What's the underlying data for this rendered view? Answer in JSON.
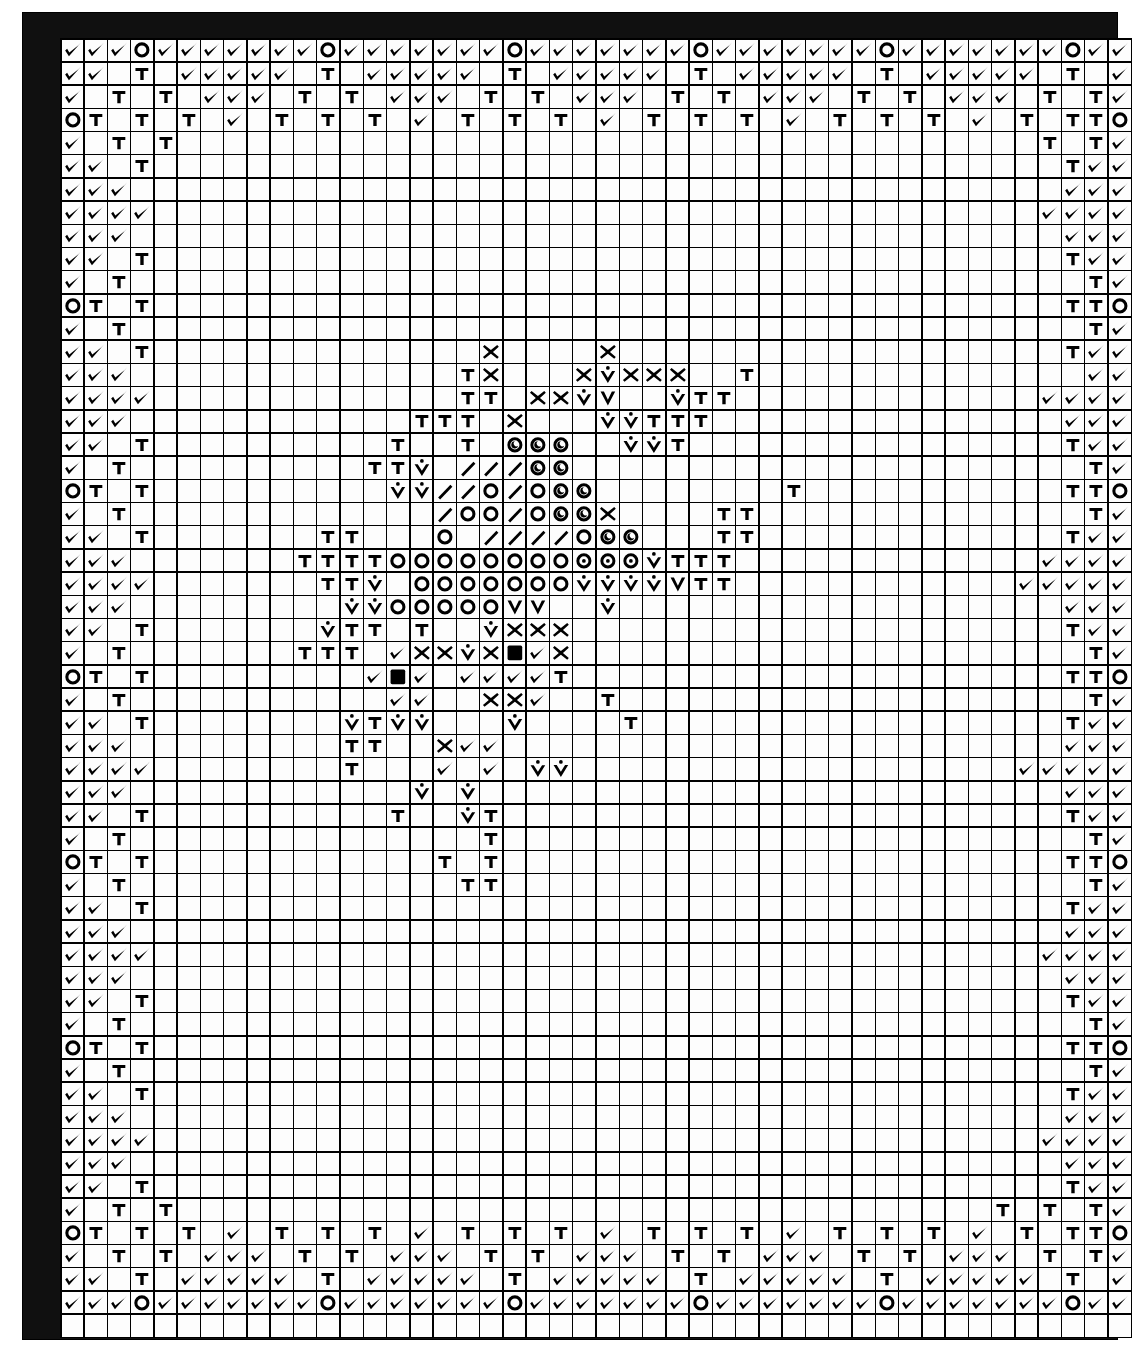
{
  "document": {
    "type": "cross-stitch-chart",
    "title": "Counted Cross Stitch Pattern Chart",
    "grid": {
      "columns": 46,
      "rows": 56
    },
    "frame_color": "#101010",
    "cell_color": "#fdfdfd",
    "line_color": "#000000"
  },
  "symbol_legend": [
    {
      "key": "check",
      "name": "checkmark-symbol",
      "glyph": "✔"
    },
    {
      "key": "tee",
      "name": "tee-symbol",
      "glyph": "T"
    },
    {
      "key": "ring",
      "name": "open-circle-symbol",
      "glyph": "○"
    },
    {
      "key": "ringdot",
      "name": "circle-with-dot-symbol",
      "glyph": "⊙"
    },
    {
      "key": "ringcoma",
      "name": "circle-with-comma-symbol",
      "glyph": "◔"
    },
    {
      "key": "ex",
      "name": "cross-x-symbol",
      "glyph": "✕"
    },
    {
      "key": "vdot",
      "name": "v-with-dot-symbol",
      "glyph": "V̇"
    },
    {
      "key": "vee",
      "name": "plain-v-symbol",
      "glyph": "V"
    },
    {
      "key": "slash",
      "name": "diagonal-slash-symbol",
      "glyph": "/"
    },
    {
      "key": "filled",
      "name": "filled-square-symbol",
      "glyph": "■"
    },
    {
      "key": "blank",
      "name": "empty-cell",
      "glyph": ""
    }
  ],
  "chart_data": {
    "type": "heatmap",
    "xlabel": "",
    "ylabel": "",
    "columns": 46,
    "rows": 56,
    "legend_position": "none",
    "grid": true,
    "symbols": [
      "check",
      "tee",
      "ring",
      "ringdot",
      "ringcoma",
      "ex",
      "vdot",
      "vee",
      "slash",
      "filled",
      "blank"
    ],
    "cells": [
      "check,check,check,ring,check,check,check,check,check,check,check,ring,check,check,check,check,check,check,check,ring,check,check,check,check,check,check,check,ring,check,check,check,check,check,check,check,ring,check,check,check,check,check,check,check,ring,check,check",
      "check,check,blank,tee,blank,check,check,check,check,check,blank,tee,blank,check,check,check,check,check,blank,tee,blank,check,check,check,check,check,blank,tee,blank,check,check,check,check,check,blank,tee,blank,check,check,check,check,check,blank,tee,blank,check",
      "check,blank,tee,blank,tee,blank,check,check,check,blank,tee,blank,tee,blank,check,check,check,blank,tee,blank,tee,blank,check,check,check,blank,tee,blank,tee,blank,check,check,check,blank,tee,blank,tee,blank,check,check,check,blank,tee,blank,tee,check",
      "ring,tee,blank,tee,blank,tee,blank,check,blank,tee,blank,tee,blank,tee,blank,check,blank,tee,blank,tee,blank,tee,blank,check,blank,tee,blank,tee,blank,tee,blank,check,blank,tee,blank,tee,blank,tee,blank,check,blank,tee,blank,tee,tee,ring",
      "check,blank,tee,blank,tee,blank,blank,blank,blank,blank,blank,blank,blank,blank,blank,blank,blank,blank,blank,blank,blank,blank,blank,blank,blank,blank,blank,blank,blank,blank,blank,blank,blank,blank,blank,blank,blank,blank,blank,blank,blank,blank,tee,blank,tee,check",
      "check,check,blank,tee,blank,blank,blank,blank,blank,blank,blank,blank,blank,blank,blank,blank,blank,blank,blank,blank,blank,blank,blank,blank,blank,blank,blank,blank,blank,blank,blank,blank,blank,blank,blank,blank,blank,blank,blank,blank,blank,blank,blank,tee,check,check",
      "check,check,check,blank,blank,blank,blank,blank,blank,blank,blank,blank,blank,blank,blank,blank,blank,blank,blank,blank,blank,blank,blank,blank,blank,blank,blank,blank,blank,blank,blank,blank,blank,blank,blank,blank,blank,blank,blank,blank,blank,blank,blank,check,check,check",
      "check,check,check,check,blank,blank,blank,blank,blank,blank,blank,blank,blank,blank,blank,blank,blank,blank,blank,blank,blank,blank,blank,blank,blank,blank,blank,blank,blank,blank,blank,blank,blank,blank,blank,blank,blank,blank,blank,blank,blank,blank,check,check,check,check",
      "check,check,check,blank,blank,blank,blank,blank,blank,blank,blank,blank,blank,blank,blank,blank,blank,blank,blank,blank,blank,blank,blank,blank,blank,blank,blank,blank,blank,blank,blank,blank,blank,blank,blank,blank,blank,blank,blank,blank,blank,blank,blank,check,check,check",
      "check,check,blank,tee,blank,blank,blank,blank,blank,blank,blank,blank,blank,blank,blank,blank,blank,blank,blank,blank,blank,blank,blank,blank,blank,blank,blank,blank,blank,blank,blank,blank,blank,blank,blank,blank,blank,blank,blank,blank,blank,blank,blank,tee,check,check",
      "check,blank,tee,blank,blank,blank,blank,blank,blank,blank,blank,blank,blank,blank,blank,blank,blank,blank,blank,blank,blank,blank,blank,blank,blank,blank,blank,blank,blank,blank,blank,blank,blank,blank,blank,blank,blank,blank,blank,blank,blank,blank,blank,blank,tee,check",
      "ring,tee,blank,tee,blank,blank,blank,blank,blank,blank,blank,blank,blank,blank,blank,blank,blank,blank,blank,blank,blank,blank,blank,blank,blank,blank,blank,blank,blank,blank,blank,blank,blank,blank,blank,blank,blank,blank,blank,blank,blank,blank,blank,tee,tee,ring",
      "check,blank,tee,blank,blank,blank,blank,blank,blank,blank,blank,blank,blank,blank,blank,blank,blank,blank,blank,blank,blank,blank,blank,blank,blank,blank,blank,blank,blank,blank,blank,blank,blank,blank,blank,blank,blank,blank,blank,blank,blank,blank,blank,blank,tee,check",
      "check,check,blank,tee,blank,blank,blank,blank,blank,blank,blank,blank,blank,blank,blank,blank,blank,blank,ex,blank,blank,blank,blank,ex,blank,blank,blank,blank,blank,blank,blank,blank,blank,blank,blank,blank,blank,blank,blank,blank,blank,blank,blank,tee,check,check",
      "check,check,check,blank,blank,blank,blank,blank,blank,blank,blank,blank,blank,blank,blank,blank,blank,tee,ex,blank,blank,blank,ex,vdot,ex,ex,ex,blank,blank,tee,blank,blank,blank,blank,blank,blank,blank,blank,blank,blank,blank,blank,blank,blank,check,check",
      "check,check,check,check,blank,blank,blank,blank,blank,blank,blank,blank,blank,blank,blank,blank,blank,tee,tee,blank,ex,ex,vdot,vee,blank,blank,vdot,tee,tee,blank,blank,blank,blank,blank,blank,blank,blank,blank,blank,blank,blank,blank,check,check,check,check",
      "check,check,check,blank,blank,blank,blank,blank,blank,blank,blank,blank,blank,blank,blank,tee,tee,tee,blank,ex,blank,blank,blank,vdot,vdot,tee,tee,tee,blank,blank,blank,blank,blank,blank,blank,blank,blank,blank,blank,blank,blank,blank,blank,check,check,check",
      "check,check,blank,tee,blank,blank,blank,blank,blank,blank,blank,blank,blank,blank,tee,blank,blank,tee,blank,ringcoma,ringcoma,ringcoma,blank,blank,vdot,vdot,tee,blank,blank,blank,blank,blank,blank,blank,blank,blank,blank,blank,blank,blank,blank,blank,blank,tee,check,check",
      "check,blank,tee,blank,blank,blank,blank,blank,blank,blank,blank,blank,blank,tee,tee,vdot,blank,slash,slash,slash,ringcoma,ringcoma,blank,blank,blank,blank,blank,blank,blank,blank,blank,blank,blank,blank,blank,blank,blank,blank,blank,blank,blank,blank,blank,blank,tee,check",
      "ring,tee,blank,tee,blank,blank,blank,blank,blank,blank,blank,blank,blank,blank,vdot,vdot,slash,slash,ring,slash,ring,ringcoma,ringcoma,blank,blank,blank,blank,blank,blank,blank,blank,tee,blank,blank,blank,blank,blank,blank,blank,blank,blank,blank,blank,tee,tee,ring",
      "check,blank,tee,blank,blank,blank,blank,blank,blank,blank,blank,blank,blank,blank,blank,blank,slash,ring,ring,slash,ring,ringcoma,ringcoma,ex,blank,blank,blank,blank,tee,tee,blank,blank,blank,blank,blank,blank,blank,blank,blank,blank,blank,blank,blank,blank,tee,check",
      "check,check,blank,tee,blank,blank,blank,blank,blank,blank,blank,tee,tee,blank,blank,blank,ring,blank,slash,slash,slash,slash,ring,ringcoma,ringcoma,blank,blank,blank,tee,tee,blank,blank,blank,blank,blank,blank,blank,blank,blank,blank,blank,blank,blank,tee,check,check",
      "check,check,check,blank,blank,blank,blank,blank,blank,blank,tee,tee,tee,tee,ring,ring,ring,ring,ring,ring,ring,ring,ringdot,ringdot,ringdot,vdot,tee,tee,tee,blank,blank,blank,blank,blank,blank,blank,blank,blank,blank,blank,blank,blank,check,check,check,check",
      "check,check,check,check,blank,blank,blank,blank,blank,blank,blank,tee,tee,vdot,blank,ring,ring,ring,ring,ring,ring,ring,vdot,vdot,vdot,vdot,vee,tee,tee,blank,blank,blank,blank,blank,blank,blank,blank,blank,blank,blank,blank,check,check,check,check,check",
      "check,check,check,blank,blank,blank,blank,blank,blank,blank,blank,blank,vdot,vdot,ring,ring,ring,ring,ring,vee,vee,blank,blank,vdot,blank,blank,blank,blank,blank,blank,blank,blank,blank,blank,blank,blank,blank,blank,blank,blank,blank,blank,blank,check,check,check",
      "check,check,blank,tee,blank,blank,blank,blank,blank,blank,blank,vdot,tee,tee,blank,tee,blank,blank,vdot,ex,ex,ex,blank,blank,blank,blank,blank,blank,blank,blank,blank,blank,blank,blank,blank,blank,blank,blank,blank,blank,blank,blank,blank,tee,check,check",
      "check,blank,tee,blank,blank,blank,blank,blank,blank,blank,tee,tee,tee,blank,check,ex,ex,vdot,ex,filled,check,ex,blank,blank,blank,blank,blank,blank,blank,blank,blank,blank,blank,blank,blank,blank,blank,blank,blank,blank,blank,blank,blank,blank,tee,check",
      "ring,tee,blank,tee,blank,blank,blank,blank,blank,blank,blank,blank,blank,check,filled,check,blank,check,check,check,check,tee,blank,blank,blank,blank,blank,blank,blank,blank,blank,blank,blank,blank,blank,blank,blank,blank,blank,blank,blank,blank,blank,tee,tee,ring",
      "check,blank,tee,blank,blank,blank,blank,blank,blank,blank,blank,blank,blank,blank,check,check,blank,blank,ex,ex,check,blank,blank,tee,blank,blank,blank,blank,blank,blank,blank,blank,blank,blank,blank,blank,blank,blank,blank,blank,blank,blank,blank,blank,tee,check",
      "check,check,blank,tee,blank,blank,blank,blank,blank,blank,blank,blank,vdot,tee,vdot,vdot,blank,blank,blank,vdot,blank,blank,blank,blank,tee,blank,blank,blank,blank,blank,blank,blank,blank,blank,blank,blank,blank,blank,blank,blank,blank,blank,blank,tee,check,check",
      "check,check,check,blank,blank,blank,blank,blank,blank,blank,blank,blank,tee,tee,blank,blank,ex,check,check,blank,blank,blank,blank,blank,blank,blank,blank,blank,blank,blank,blank,blank,blank,blank,blank,blank,blank,blank,blank,blank,blank,blank,blank,check,check,check",
      "check,check,check,check,blank,blank,blank,blank,blank,blank,blank,blank,tee,blank,blank,blank,check,blank,check,blank,vdot,vdot,blank,blank,blank,blank,blank,blank,blank,blank,blank,blank,blank,blank,blank,blank,blank,blank,blank,blank,blank,check,check,check,check,check",
      "check,check,check,blank,blank,blank,blank,blank,blank,blank,blank,blank,blank,blank,blank,vdot,blank,vdot,blank,blank,blank,blank,blank,blank,blank,blank,blank,blank,blank,blank,blank,blank,blank,blank,blank,blank,blank,blank,blank,blank,blank,blank,blank,check,check,check",
      "check,check,blank,tee,blank,blank,blank,blank,blank,blank,blank,blank,blank,blank,tee,blank,blank,vdot,tee,blank,blank,blank,blank,blank,blank,blank,blank,blank,blank,blank,blank,blank,blank,blank,blank,blank,blank,blank,blank,blank,blank,blank,blank,tee,check,check",
      "check,blank,tee,blank,blank,blank,blank,blank,blank,blank,blank,blank,blank,blank,blank,blank,blank,blank,tee,blank,blank,blank,blank,blank,blank,blank,blank,blank,blank,blank,blank,blank,blank,blank,blank,blank,blank,blank,blank,blank,blank,blank,blank,blank,tee,check",
      "ring,tee,blank,tee,blank,blank,blank,blank,blank,blank,blank,blank,blank,blank,blank,blank,tee,blank,tee,blank,blank,blank,blank,blank,blank,blank,blank,blank,blank,blank,blank,blank,blank,blank,blank,blank,blank,blank,blank,blank,blank,blank,blank,tee,tee,ring",
      "check,blank,tee,blank,blank,blank,blank,blank,blank,blank,blank,blank,blank,blank,blank,blank,blank,tee,tee,blank,blank,blank,blank,blank,blank,blank,blank,blank,blank,blank,blank,blank,blank,blank,blank,blank,blank,blank,blank,blank,blank,blank,blank,blank,tee,check",
      "check,check,blank,tee,blank,blank,blank,blank,blank,blank,blank,blank,blank,blank,blank,blank,blank,blank,blank,blank,blank,blank,blank,blank,blank,blank,blank,blank,blank,blank,blank,blank,blank,blank,blank,blank,blank,blank,blank,blank,blank,blank,blank,tee,check,check",
      "check,check,check,blank,blank,blank,blank,blank,blank,blank,blank,blank,blank,blank,blank,blank,blank,blank,blank,blank,blank,blank,blank,blank,blank,blank,blank,blank,blank,blank,blank,blank,blank,blank,blank,blank,blank,blank,blank,blank,blank,blank,blank,check,check,check",
      "check,check,check,check,blank,blank,blank,blank,blank,blank,blank,blank,blank,blank,blank,blank,blank,blank,blank,blank,blank,blank,blank,blank,blank,blank,blank,blank,blank,blank,blank,blank,blank,blank,blank,blank,blank,blank,blank,blank,blank,blank,check,check,check,check",
      "check,check,check,blank,blank,blank,blank,blank,blank,blank,blank,blank,blank,blank,blank,blank,blank,blank,blank,blank,blank,blank,blank,blank,blank,blank,blank,blank,blank,blank,blank,blank,blank,blank,blank,blank,blank,blank,blank,blank,blank,blank,blank,check,check,check",
      "check,check,blank,tee,blank,blank,blank,blank,blank,blank,blank,blank,blank,blank,blank,blank,blank,blank,blank,blank,blank,blank,blank,blank,blank,blank,blank,blank,blank,blank,blank,blank,blank,blank,blank,blank,blank,blank,blank,blank,blank,blank,blank,tee,check,check",
      "check,blank,tee,blank,blank,blank,blank,blank,blank,blank,blank,blank,blank,blank,blank,blank,blank,blank,blank,blank,blank,blank,blank,blank,blank,blank,blank,blank,blank,blank,blank,blank,blank,blank,blank,blank,blank,blank,blank,blank,blank,blank,blank,blank,tee,check",
      "ring,tee,blank,tee,blank,blank,blank,blank,blank,blank,blank,blank,blank,blank,blank,blank,blank,blank,blank,blank,blank,blank,blank,blank,blank,blank,blank,blank,blank,blank,blank,blank,blank,blank,blank,blank,blank,blank,blank,blank,blank,blank,blank,tee,tee,ring",
      "check,blank,tee,blank,blank,blank,blank,blank,blank,blank,blank,blank,blank,blank,blank,blank,blank,blank,blank,blank,blank,blank,blank,blank,blank,blank,blank,blank,blank,blank,blank,blank,blank,blank,blank,blank,blank,blank,blank,blank,blank,blank,blank,blank,tee,check",
      "check,check,blank,tee,blank,blank,blank,blank,blank,blank,blank,blank,blank,blank,blank,blank,blank,blank,blank,blank,blank,blank,blank,blank,blank,blank,blank,blank,blank,blank,blank,blank,blank,blank,blank,blank,blank,blank,blank,blank,blank,blank,blank,tee,check,check",
      "check,check,check,blank,blank,blank,blank,blank,blank,blank,blank,blank,blank,blank,blank,blank,blank,blank,blank,blank,blank,blank,blank,blank,blank,blank,blank,blank,blank,blank,blank,blank,blank,blank,blank,blank,blank,blank,blank,blank,blank,blank,blank,check,check,check",
      "check,check,check,check,blank,blank,blank,blank,blank,blank,blank,blank,blank,blank,blank,blank,blank,blank,blank,blank,blank,blank,blank,blank,blank,blank,blank,blank,blank,blank,blank,blank,blank,blank,blank,blank,blank,blank,blank,blank,blank,blank,check,check,check,check",
      "check,check,check,blank,blank,blank,blank,blank,blank,blank,blank,blank,blank,blank,blank,blank,blank,blank,blank,blank,blank,blank,blank,blank,blank,blank,blank,blank,blank,blank,blank,blank,blank,blank,blank,blank,blank,blank,blank,blank,blank,blank,blank,check,check,check",
      "check,check,blank,tee,blank,blank,blank,blank,blank,blank,blank,blank,blank,blank,blank,blank,blank,blank,blank,blank,blank,blank,blank,blank,blank,blank,blank,blank,blank,blank,blank,blank,blank,blank,blank,blank,blank,blank,blank,blank,blank,blank,blank,tee,check,check",
      "check,blank,tee,blank,tee,blank,blank,blank,blank,blank,blank,blank,blank,blank,blank,blank,blank,blank,blank,blank,blank,blank,blank,blank,blank,blank,blank,blank,blank,blank,blank,blank,blank,blank,blank,blank,blank,blank,blank,blank,tee,blank,tee,blank,tee,check",
      "ring,tee,blank,tee,blank,tee,blank,check,blank,tee,blank,tee,blank,tee,blank,check,blank,tee,blank,tee,blank,tee,blank,check,blank,tee,blank,tee,blank,tee,blank,check,blank,tee,blank,tee,blank,tee,blank,check,blank,tee,blank,tee,tee,ring",
      "check,blank,tee,blank,tee,blank,check,check,check,blank,tee,blank,tee,blank,check,check,check,blank,tee,blank,tee,blank,check,check,check,blank,tee,blank,tee,blank,check,check,check,blank,tee,blank,tee,blank,check,check,check,blank,tee,blank,tee,check",
      "check,check,blank,tee,blank,check,check,check,check,check,blank,tee,blank,check,check,check,check,check,blank,tee,blank,check,check,check,check,check,blank,tee,blank,check,check,check,check,check,blank,tee,blank,check,check,check,check,check,blank,tee,blank,check",
      "check,check,check,ring,check,check,check,check,check,check,check,ring,check,check,check,check,check,check,check,ring,check,check,check,check,check,check,check,ring,check,check,check,check,check,check,check,ring,check,check,check,check,check,check,check,ring,check,check"
    ]
  }
}
